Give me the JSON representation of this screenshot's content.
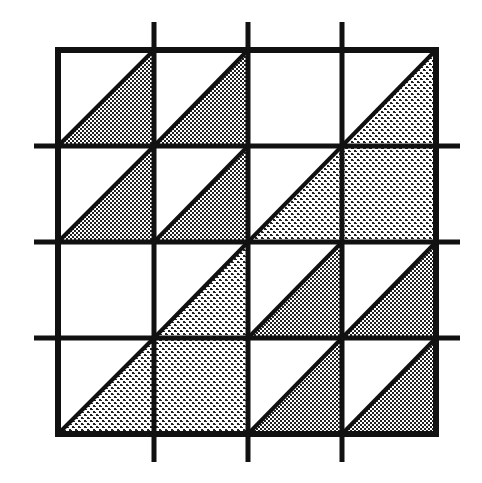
{
  "diagram": {
    "type": "tiling-grid",
    "rows": 4,
    "cols": 4,
    "grid": {
      "left": 58,
      "top": 50,
      "right": 436,
      "bottom": 434
    },
    "v_lines": [
      58,
      154,
      248,
      342,
      436
    ],
    "h_lines": [
      50,
      146,
      242,
      338,
      434
    ],
    "extensions": {
      "top": 22,
      "bottom": 462,
      "left": 34,
      "right": 460
    },
    "line_color": "#111111",
    "fill_colors": {
      "fine": "#9a9a9a",
      "coarse": "#b5b5b5"
    },
    "cells": [
      [
        "fine-triangle",
        "fine-triangle",
        "empty",
        "coarse-triangle"
      ],
      [
        "fine-triangle",
        "fine-triangle",
        "coarse-triangle",
        "coarse-square"
      ],
      [
        "empty",
        "coarse-triangle",
        "fine-triangle",
        "fine-triangle"
      ],
      [
        "coarse-triangle",
        "coarse-square",
        "fine-triangle",
        "fine-triangle"
      ]
    ]
  }
}
